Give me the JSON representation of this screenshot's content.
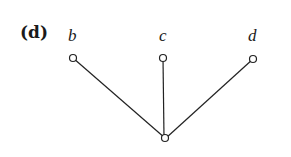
{
  "panel_label": "(d)",
  "nodes": [
    {
      "id": "b",
      "label": "b",
      "x": 73,
      "y": 58
    },
    {
      "id": "c",
      "label": "c",
      "x": 163,
      "y": 58
    },
    {
      "id": "d",
      "label": "d",
      "x": 253,
      "y": 59
    },
    {
      "id": "root",
      "label": "",
      "x": 165,
      "y": 138
    }
  ],
  "edges": [
    {
      "from": "b",
      "to": "root"
    },
    {
      "from": "c",
      "to": "root"
    },
    {
      "from": "d",
      "to": "root"
    }
  ]
}
